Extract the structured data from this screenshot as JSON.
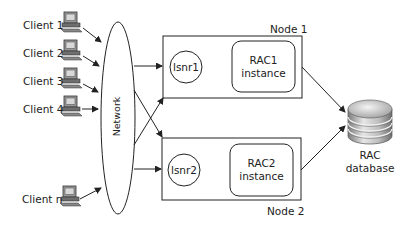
{
  "diagram": {
    "clients": [
      {
        "label": "Client 1"
      },
      {
        "label": "Client 2"
      },
      {
        "label": "Client 3"
      },
      {
        "label": "Client 4"
      },
      {
        "label": "Client n"
      }
    ],
    "network": {
      "label": "Network"
    },
    "nodes": [
      {
        "label": "Node 1",
        "listener": "lsnr1",
        "instance_line1": "RAC1",
        "instance_line2": "instance"
      },
      {
        "label": "Node 2",
        "listener": "lsnr2",
        "instance_line1": "RAC2",
        "instance_line2": "instance"
      }
    ],
    "database": {
      "line1": "RAC",
      "line2": "database"
    },
    "colors": {
      "stroke": "#222222",
      "text": "#222222",
      "db_light": "#e8e8e8",
      "db_dark": "#8a8a8a"
    }
  }
}
